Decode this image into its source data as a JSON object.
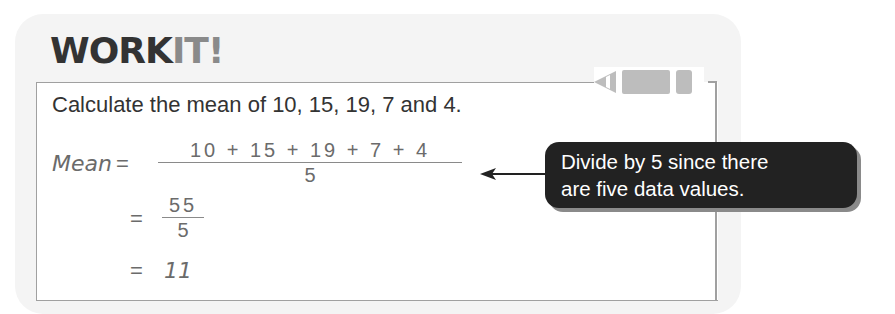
{
  "header": {
    "title_part1": "WORK",
    "title_part2": "IT!"
  },
  "icons": {
    "pencil": "pencil-icon",
    "arrow": "arrow-left-icon"
  },
  "question": "Calculate the mean of 10, 15, 19, 7 and 4.",
  "working": {
    "label": "Mean",
    "equals": "=",
    "step1": {
      "numerator": "10 + 15 + 19 + 7 + 4",
      "denominator": "5"
    },
    "step2": {
      "numerator": "55",
      "denominator": "5"
    },
    "step3": "11"
  },
  "callout": {
    "line1": "Divide by 5 since there",
    "line2": "are five data values."
  },
  "colors": {
    "title_dark": "#333333",
    "title_light": "#8a8a8a",
    "callout_bg": "#222222",
    "panel_bg": "#f4f4f4"
  }
}
